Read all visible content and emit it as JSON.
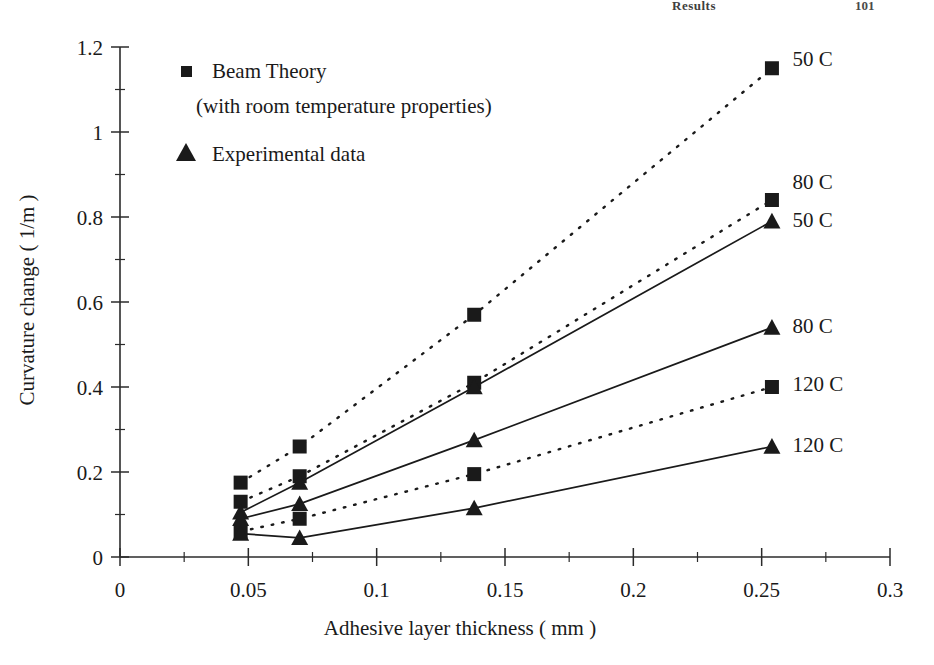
{
  "page_header": {
    "title": "Results",
    "page_number": "101"
  },
  "legend": {
    "items": [
      {
        "marker": "square",
        "label": "Beam Theory",
        "sublabel": "(with room temperature properties)"
      },
      {
        "marker": "triangle",
        "label": "Experimental data",
        "sublabel": ""
      }
    ]
  },
  "chart_data": {
    "type": "line",
    "title": "",
    "xlabel": "Adhesive layer thickness ( mm )",
    "ylabel": "Curvature change ( 1/m )",
    "xlim": [
      0,
      0.3
    ],
    "ylim": [
      0,
      1.2
    ],
    "xticks": [
      "0",
      "0.05",
      "0.1",
      "0.15",
      "0.2",
      "0.25",
      "0.3"
    ],
    "xtick_values": [
      0,
      0.05,
      0.1,
      0.15,
      0.2,
      0.25,
      0.3
    ],
    "xminor_values": [
      0.025,
      0.075,
      0.125,
      0.175,
      0.225,
      0.275
    ],
    "yticks": [
      "0",
      "0.2",
      "0.4",
      "0.6",
      "0.8",
      "1",
      "1.2"
    ],
    "ytick_values": [
      0,
      0.2,
      0.4,
      0.6,
      0.8,
      1.0,
      1.2
    ],
    "yminor_values": [
      0.1,
      0.3,
      0.5,
      0.7,
      0.9,
      1.1
    ],
    "grid": false,
    "legend_position": "inside-top-left",
    "x": [
      0.047,
      0.07,
      0.138,
      0.254
    ],
    "series": [
      {
        "name": "Beam Theory 50 C",
        "label": "50 C",
        "marker": "square",
        "line": "dotted",
        "label_x": 0.262,
        "label_y": 1.175,
        "values": [
          0.175,
          0.26,
          0.57,
          1.15
        ]
      },
      {
        "name": "Beam Theory 80 C",
        "label": "80 C",
        "marker": "square",
        "line": "dotted",
        "label_x": 0.262,
        "label_y": 0.885,
        "values": [
          0.13,
          0.19,
          0.41,
          0.84
        ]
      },
      {
        "name": "Experimental 50 C",
        "label": "50 C",
        "marker": "triangle",
        "line": "solid",
        "label_x": 0.262,
        "label_y": 0.795,
        "values": [
          0.105,
          0.175,
          0.4,
          0.79
        ]
      },
      {
        "name": "Experimental 80 C",
        "label": "80 C",
        "marker": "triangle",
        "line": "solid",
        "label_x": 0.262,
        "label_y": 0.545,
        "values": [
          0.09,
          0.125,
          0.275,
          0.54
        ]
      },
      {
        "name": "Beam Theory 120 C",
        "label": "120 C",
        "marker": "square",
        "line": "dotted",
        "label_x": 0.262,
        "label_y": 0.41,
        "values": [
          0.06,
          0.09,
          0.195,
          0.4
        ]
      },
      {
        "name": "Experimental 120 C",
        "label": "120 C",
        "marker": "triangle",
        "line": "solid",
        "label_x": 0.262,
        "label_y": 0.265,
        "values": [
          0.055,
          0.045,
          0.115,
          0.26
        ]
      }
    ]
  },
  "colors": {
    "ink": "#1a1a1a",
    "axis": "#2b2b2b",
    "background": "#ffffff"
  }
}
